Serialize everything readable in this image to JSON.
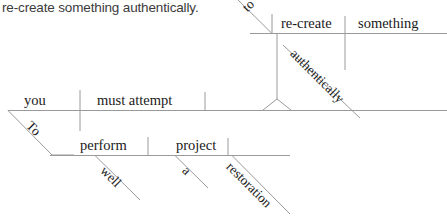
{
  "caption": {
    "text": "re-create something authentically."
  },
  "diagram": {
    "type": "reed-kellogg-sentence-diagram",
    "line_color": "#9a9a9a",
    "text_color": "#1a1a1a",
    "sentence": "To perform a restoration well you must attempt to re-create something authentically.",
    "clauses": [
      {
        "name": "main-clause",
        "subject": "you",
        "predicate": "must attempt",
        "baseline_y": 110
      },
      {
        "name": "infinitive-phrase-lower",
        "verb": "perform",
        "object": "project",
        "baseline_y": 155
      },
      {
        "name": "infinitive-phrase-upper",
        "verb": "re-create",
        "object": "something",
        "baseline_y": 33
      }
    ],
    "words": {
      "you": "you",
      "must_attempt": "must attempt",
      "to_lower": "To",
      "perform": "perform",
      "well": "well",
      "project": "project",
      "a": "a",
      "restoration": "restoration",
      "to_upper": "to",
      "re_create": "re-create",
      "something": "something",
      "authentically": "authentically"
    }
  }
}
